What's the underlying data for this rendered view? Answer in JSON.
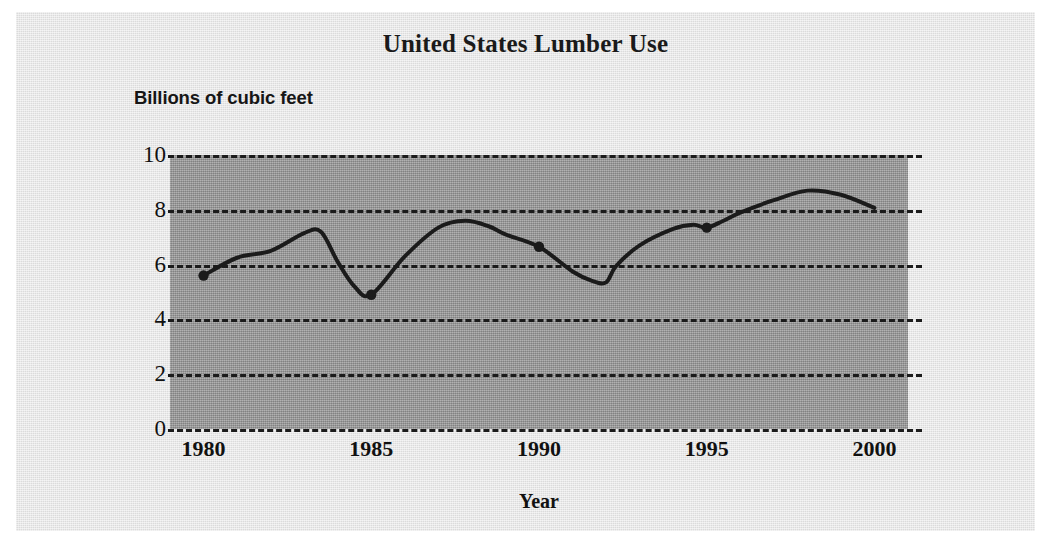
{
  "figure": {
    "title": "United States Lumber Use",
    "y_axis_title": "Billions of cubic feet",
    "x_axis_title": "Year",
    "background_color": "#e3e3e3",
    "plot_background_color": "#9d9d9d",
    "line_color": "#1b1b1b",
    "gridline_color": "#1b1b1b"
  },
  "chart_data": {
    "type": "line",
    "title": "United States Lumber Use",
    "subtitle": "",
    "xlabel": "Year",
    "ylabel": "Billions of cubic feet",
    "xlim": [
      1979.0,
      2001.0
    ],
    "ylim": [
      0,
      10
    ],
    "xticks": [
      1980,
      1985,
      1990,
      1995,
      2000
    ],
    "xtick_labels": [
      "1980",
      "1985",
      "1990",
      "1995",
      "2000"
    ],
    "yticks": [
      0,
      2,
      4,
      6,
      8,
      10
    ],
    "ytick_labels": [
      "0",
      "2",
      "4",
      "6",
      "8",
      "10"
    ],
    "grid": "horizontal-dashed",
    "legend": "none",
    "series": [
      {
        "name": "U.S. lumber use",
        "x": [
          1980,
          1981,
          1982,
          1983,
          1983.5,
          1984,
          1984.5,
          1985,
          1986,
          1987,
          1987.8,
          1988.5,
          1989,
          1990,
          1991,
          1991.6,
          1992,
          1992.3,
          1993,
          1994,
          1994.6,
          1995,
          1995.5,
          1996,
          1997,
          1998,
          1999,
          2000
        ],
        "y": [
          5.6,
          6.25,
          6.5,
          7.15,
          7.2,
          6.1,
          5.2,
          4.9,
          6.3,
          7.35,
          7.6,
          7.4,
          7.1,
          6.65,
          5.75,
          5.4,
          5.35,
          5.95,
          6.7,
          7.3,
          7.45,
          7.35,
          7.6,
          7.9,
          8.35,
          8.7,
          8.55,
          8.07
        ],
        "markers": [
          {
            "x": 1980,
            "y": 5.6
          },
          {
            "x": 1985,
            "y": 4.9
          },
          {
            "x": 1990,
            "y": 6.65
          },
          {
            "x": 1995,
            "y": 7.35
          }
        ]
      }
    ],
    "annotations": []
  }
}
